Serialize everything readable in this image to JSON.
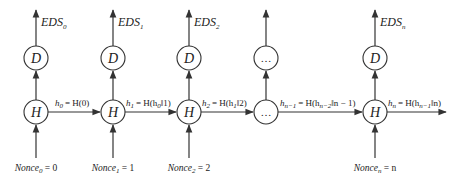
{
  "diagram": {
    "colors": {
      "stroke": "#333333",
      "text": "#222222",
      "background": "#ffffff"
    },
    "columns": [
      {
        "id": "col0",
        "output": {
          "base": "EDS",
          "sub": "0"
        },
        "top_node": "D",
        "hash_node": "H",
        "nonce": {
          "base": "Nonce",
          "sub": "0",
          "value": "0"
        }
      },
      {
        "id": "col1",
        "output": {
          "base": "EDS",
          "sub": "1"
        },
        "top_node": "D",
        "hash_node": "H",
        "nonce": {
          "base": "Nonce",
          "sub": "1",
          "value": "1"
        }
      },
      {
        "id": "col2",
        "output": {
          "base": "EDS",
          "sub": "2"
        },
        "top_node": "D",
        "hash_node": "H",
        "nonce": {
          "base": "Nonce",
          "sub": "2",
          "value": "2"
        }
      },
      {
        "id": "col3",
        "output": null,
        "top_node": "…",
        "hash_node": "…",
        "nonce": null
      },
      {
        "id": "coln",
        "output": {
          "base": "EDS",
          "sub": "n"
        },
        "top_node": "D",
        "hash_node": "H",
        "nonce": {
          "base": "Nonce",
          "sub": "n",
          "value": "n"
        }
      }
    ],
    "edges": [
      {
        "lhs": "h",
        "lhs_sub": "0",
        "rhs": "= H(0)"
      },
      {
        "lhs": "h",
        "lhs_sub": "1",
        "rhs_pre": "= H(h",
        "rhs_sub": "0",
        "rhs_post": "‖1)"
      },
      {
        "lhs": "h",
        "lhs_sub": "2",
        "rhs_pre": "= H(h",
        "rhs_sub": "1",
        "rhs_post": "‖2)"
      },
      {
        "lhs": "h",
        "lhs_sub": "n−1",
        "rhs_pre": "= H(h",
        "rhs_sub": "n−2",
        "rhs_post": "‖n − 1)"
      },
      {
        "lhs": "h",
        "lhs_sub": "n",
        "rhs_pre": "= H(h",
        "rhs_sub": "n−1",
        "rhs_post": "‖n)"
      }
    ],
    "equals_sign": " = "
  }
}
